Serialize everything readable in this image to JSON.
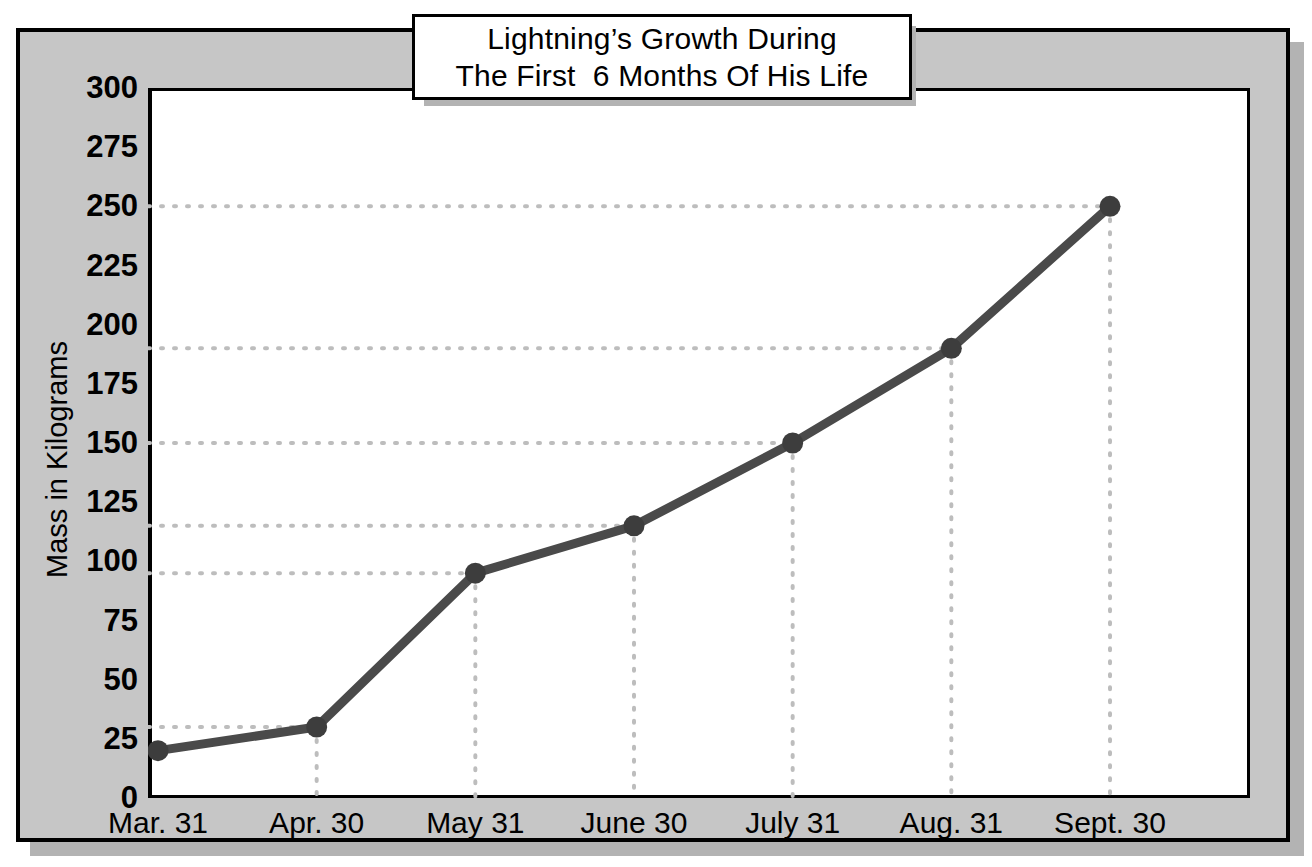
{
  "chart_data": {
    "type": "line",
    "title_lines": [
      "Lightning’s Growth During",
      "The First  6 Months Of His Life"
    ],
    "xlabel": "",
    "ylabel": "Mass in Kilograms",
    "categories": [
      "Mar. 31",
      "Apr. 30",
      "May 31",
      "June 30",
      "July 31",
      "Aug. 31",
      "Sept. 30"
    ],
    "values": [
      20,
      30,
      95,
      115,
      150,
      190,
      250
    ],
    "ylim": [
      0,
      300
    ],
    "ytick_values": [
      0,
      25,
      50,
      75,
      100,
      125,
      150,
      175,
      200,
      225,
      250,
      275,
      300
    ],
    "ytick_labels": [
      "0",
      "25",
      "50",
      "75",
      "100",
      "125",
      "150",
      "175",
      "200",
      "225",
      "250",
      "275",
      "300"
    ],
    "y_minor_step": 5,
    "grid": "dotted-guides-to-points",
    "legend": null,
    "series_color": "#4a4a4a",
    "marker_color": "#3d3d3d",
    "grid_color": "#bdbdbd",
    "plot_background": "#ffffff",
    "figure_background": "#c6c6c6"
  },
  "axes": {
    "y_axis_title": "Mass in Kilograms"
  }
}
